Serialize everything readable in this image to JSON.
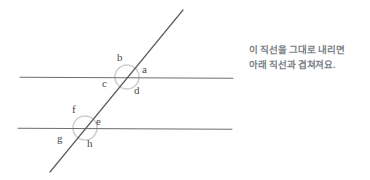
{
  "canvas": {
    "width": 370,
    "height": 180,
    "background": "#ffffff"
  },
  "figure": {
    "type": "geometry-diagram",
    "stroke_color": "#6f6f6f",
    "marker_color": "#c9c9c9",
    "lines": [
      {
        "name": "upper-parallel-line",
        "x1": 20,
        "y1": 77,
        "x2": 233,
        "y2": 78
      },
      {
        "name": "lower-parallel-line",
        "x1": 18,
        "y1": 128,
        "x2": 232,
        "y2": 129
      },
      {
        "name": "transversal-line",
        "x1": 183,
        "y1": 10,
        "x2": 50,
        "y2": 172
      }
    ],
    "intersections": [
      {
        "name": "upper-intersection",
        "cx": 127,
        "cy": 77,
        "radius": 12
      },
      {
        "name": "lower-intersection",
        "cx": 85,
        "cy": 128,
        "radius": 12
      }
    ],
    "angle_labels": [
      {
        "id": "a",
        "text": "a",
        "x": 142,
        "y": 64
      },
      {
        "id": "b",
        "text": "b",
        "x": 117,
        "y": 52
      },
      {
        "id": "c",
        "text": "c",
        "x": 102,
        "y": 78
      },
      {
        "id": "d",
        "text": "d",
        "x": 134,
        "y": 85
      },
      {
        "id": "e",
        "text": "e",
        "x": 96,
        "y": 116
      },
      {
        "id": "f",
        "text": "f",
        "x": 72,
        "y": 104
      },
      {
        "id": "g",
        "text": "g",
        "x": 57,
        "y": 133
      },
      {
        "id": "h",
        "text": "h",
        "x": 87,
        "y": 138
      }
    ]
  },
  "annotation": {
    "name": "explanation-note",
    "color": "#7a7f86",
    "line1": "이 직선을 그대로 내리면",
    "line2": "아래 직선과 겹쳐져요."
  }
}
